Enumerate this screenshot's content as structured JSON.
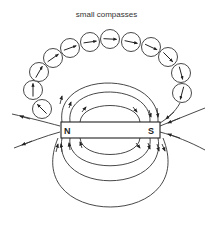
{
  "diagram": {
    "title": "small compasses",
    "magnet": {
      "north_label": "N",
      "south_label": "S"
    },
    "compasses": [
      {
        "cx": 42,
        "cy": 109,
        "angle": -135
      },
      {
        "cx": 33,
        "cy": 90,
        "angle": -90
      },
      {
        "cx": 39,
        "cy": 72,
        "angle": -60
      },
      {
        "cx": 53,
        "cy": 58,
        "angle": -35
      },
      {
        "cx": 70,
        "cy": 48,
        "angle": -20
      },
      {
        "cx": 90,
        "cy": 42,
        "angle": -8
      },
      {
        "cx": 110,
        "cy": 39,
        "angle": 3
      },
      {
        "cx": 131,
        "cy": 42,
        "angle": 12
      },
      {
        "cx": 151,
        "cy": 47,
        "angle": 25
      },
      {
        "cx": 168,
        "cy": 57,
        "angle": 45
      },
      {
        "cx": 181,
        "cy": 73,
        "angle": 75
      },
      {
        "cx": 182,
        "cy": 93,
        "angle": 105
      }
    ],
    "colors": {
      "line": "#222222",
      "background": "#ffffff"
    }
  }
}
